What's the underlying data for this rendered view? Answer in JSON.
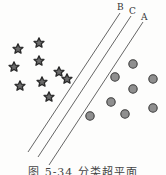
{
  "figure": {
    "caption": "图 5-34 分类超平面",
    "line_labels": {
      "A": "A",
      "B": "B",
      "C": "C"
    },
    "colors": {
      "star_fill": "#6b6b6b",
      "star_stroke": "#2a2a2a",
      "circle_fill": "#8f8f8f",
      "circle_stroke": "#3a3a3a",
      "line": "#555555"
    },
    "class_stars": [
      [
        18,
        49
      ],
      [
        39,
        43
      ],
      [
        14,
        67
      ],
      [
        39,
        61
      ],
      [
        20,
        86
      ],
      [
        42,
        82
      ],
      [
        59,
        72
      ],
      [
        67,
        79
      ],
      [
        49,
        97
      ]
    ],
    "class_circles": [
      [
        133,
        64
      ],
      [
        115,
        77
      ],
      [
        153,
        79
      ],
      [
        133,
        89
      ],
      [
        111,
        102
      ],
      [
        153,
        108
      ],
      [
        125,
        114
      ],
      [
        90,
        116
      ]
    ],
    "lines": [
      {
        "name": "B",
        "x1": 120,
        "y1": 13,
        "x2": 28,
        "y2": 152,
        "label_x": 117,
        "label_y": 10
      },
      {
        "name": "C",
        "x1": 131,
        "y1": 16,
        "x2": 38,
        "y2": 157,
        "label_x": 129,
        "label_y": 14
      },
      {
        "name": "A",
        "x1": 143,
        "y1": 22,
        "x2": 49,
        "y2": 165,
        "label_x": 141,
        "label_y": 20
      }
    ]
  }
}
